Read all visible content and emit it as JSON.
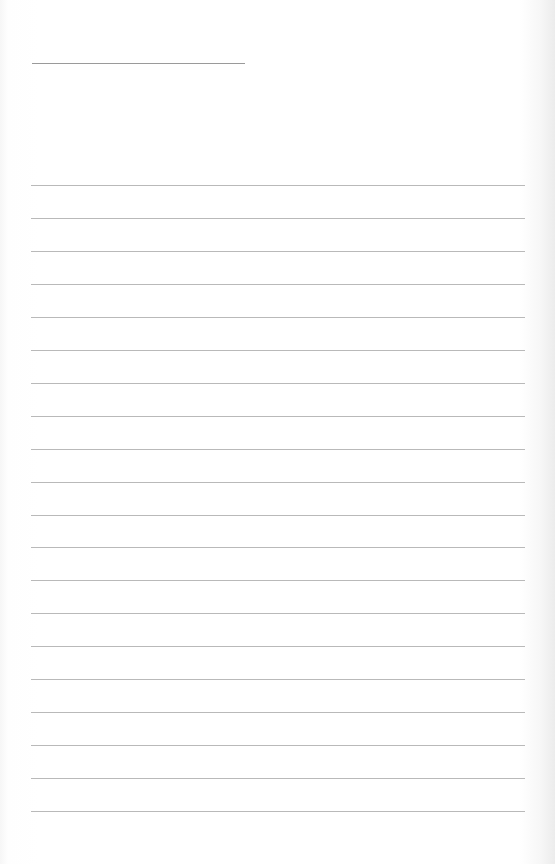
{
  "document": {
    "type": "blank lined paper",
    "title_line": {
      "x": 32,
      "y": 63,
      "width": 213,
      "color": "#9a9a9a"
    },
    "ruled_lines": {
      "count": 20,
      "first_y": 185,
      "spacing": 32.95,
      "x": 31,
      "width": 494,
      "color": "#b9b9b9"
    },
    "paper_color": "#ffffff"
  }
}
